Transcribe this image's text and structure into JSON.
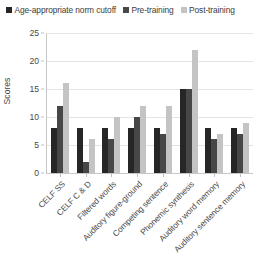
{
  "legend": {
    "position": "top",
    "entries": [
      {
        "label": "Age-appropriate norm cutoff",
        "color": "#262626",
        "icon": "square-marker-icon"
      },
      {
        "label": "Pre-training",
        "color": "#474747",
        "icon": "square-marker-icon"
      },
      {
        "label": "Post-training",
        "color": "#c4c4c4",
        "icon": "square-marker-icon"
      }
    ]
  },
  "axes": {
    "y_title": "Scores",
    "y_ticks": [
      "0",
      "5",
      "10",
      "15",
      "20",
      "25"
    ]
  },
  "chart_data": {
    "type": "bar",
    "title": "",
    "subtitle": "",
    "xlabel": "",
    "ylabel": "Scores",
    "ylim": [
      0,
      25
    ],
    "ytick_step": 5,
    "grid": true,
    "legend_position": "top",
    "categories": [
      "CELF SS",
      "CELF C & D",
      "Filtered words",
      "Auditory figure-ground",
      "Competing sentence",
      "Phonemic synthesis",
      "Auditory word memory",
      "Auditory sentence memory"
    ],
    "series": [
      {
        "name": "Age-appropriate norm cutoff",
        "color": "#262626",
        "values": [
          8,
          8,
          8,
          8,
          8,
          15,
          8,
          8
        ]
      },
      {
        "name": "Pre-training",
        "color": "#474747",
        "values": [
          12,
          2,
          6,
          10,
          7,
          15,
          6,
          7
        ]
      },
      {
        "name": "Post-training",
        "color": "#c4c4c4",
        "values": [
          16,
          6,
          10,
          12,
          12,
          22,
          7,
          9
        ]
      }
    ]
  }
}
